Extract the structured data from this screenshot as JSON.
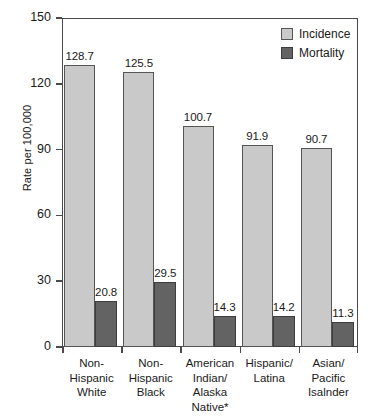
{
  "chart_data": {
    "type": "bar",
    "title": "",
    "subtitle": "",
    "xlabel": "",
    "ylabel": "Rate per 100,000",
    "ylim": [
      0,
      150
    ],
    "yticks": [
      0,
      30,
      60,
      90,
      120,
      150
    ],
    "ytick_labels": [
      "0",
      "30",
      "60",
      "90",
      "120",
      "150"
    ],
    "grid": false,
    "legend_position": "top-right",
    "categories": [
      "Non-\nHispanic\nWhite",
      "Non-\nHispanic\nBlack",
      "American\nIndian/\nAlaska\nNative*",
      "Hispanic/\nLatina",
      "Asian/\nPacific\nIsalnder"
    ],
    "category_lines": [
      [
        "Non-",
        "Hispanic",
        "White"
      ],
      [
        "Non-",
        "Hispanic",
        "Black"
      ],
      [
        "American",
        "Indian/",
        "Alaska",
        "Native*"
      ],
      [
        "Hispanic/",
        "Latina"
      ],
      [
        "Asian/",
        "Pacific",
        "Isalnder"
      ]
    ],
    "series": [
      {
        "name": "Incidence",
        "color": "#c9c9c9",
        "values": [
          128.7,
          125.5,
          100.7,
          91.9,
          90.7
        ],
        "labels": [
          "128.7",
          "125.5",
          "100.7",
          "91.9",
          "90.7"
        ]
      },
      {
        "name": "Mortality",
        "color": "#636363",
        "values": [
          20.8,
          29.5,
          14.3,
          14.2,
          11.3
        ],
        "labels": [
          "20.8",
          "29.5",
          "14.3",
          "14.2",
          "11.3"
        ]
      }
    ]
  },
  "legend": {
    "items": [
      {
        "label": "Incidence",
        "color": "#c9c9c9"
      },
      {
        "label": "Mortality",
        "color": "#636363"
      }
    ]
  },
  "colors": {
    "incidence": "#c9c9c9",
    "mortality": "#636363",
    "axis": "#4a4a4a",
    "text": "#1a1a1a",
    "background": "#ffffff"
  }
}
